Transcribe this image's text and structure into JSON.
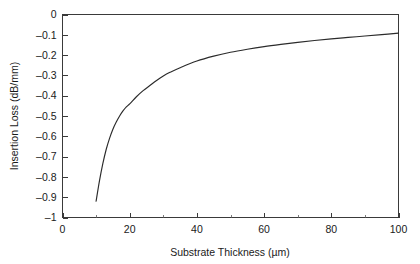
{
  "chart_data": {
    "type": "line",
    "title": "",
    "xlabel": "Substrate Thickness (µm)",
    "ylabel": "Insertion Loss (dB/mm)",
    "xlim": [
      0,
      100
    ],
    "ylim": [
      -1,
      0
    ],
    "grid": false,
    "legend": null,
    "xticks": [
      0,
      20,
      40,
      60,
      80,
      100
    ],
    "xtick_labels": [
      "0",
      "20",
      "40",
      "60",
      "80",
      "100"
    ],
    "xminor_ticks": [
      10,
      30,
      50,
      70,
      90
    ],
    "yticks": [
      0,
      -0.1,
      -0.2,
      -0.3,
      -0.4,
      -0.5,
      -0.6,
      -0.7,
      -0.8,
      -0.9,
      -1
    ],
    "ytick_labels": [
      "0",
      "–0.1",
      "–0.2",
      "–0.3",
      "–0.4",
      "–0.5",
      "–0.6",
      "–0.7",
      "–0.8",
      "–0.9",
      "–1"
    ],
    "line_color": "#2b2b2b",
    "frame_color": "#3a3a3a",
    "series": [
      {
        "name": "insertion-loss",
        "x": [
          10,
          11,
          12,
          13,
          14,
          15,
          16,
          17,
          18,
          19,
          20,
          22,
          24,
          26,
          28,
          30,
          32,
          35,
          40,
          45,
          50,
          55,
          60,
          65,
          70,
          75,
          80,
          85,
          90,
          95,
          100
        ],
        "values": [
          -0.92,
          -0.82,
          -0.735,
          -0.665,
          -0.61,
          -0.565,
          -0.53,
          -0.5,
          -0.475,
          -0.455,
          -0.44,
          -0.405,
          -0.375,
          -0.35,
          -0.325,
          -0.303,
          -0.285,
          -0.262,
          -0.229,
          -0.205,
          -0.186,
          -0.171,
          -0.158,
          -0.147,
          -0.137,
          -0.128,
          -0.12,
          -0.113,
          -0.106,
          -0.099,
          -0.092
        ]
      }
    ]
  }
}
